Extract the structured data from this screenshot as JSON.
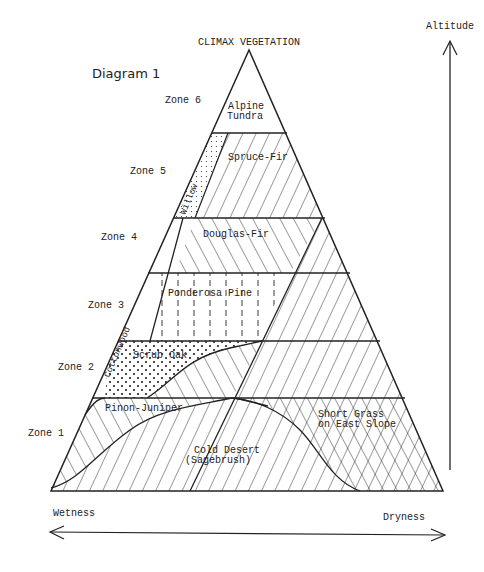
{
  "title": "CLIMAX VEGETATION",
  "diagram_label": "Diagram 1",
  "axes": {
    "vertical": "Altitude",
    "horizontal_left": "Wetness",
    "horizontal_right": "Dryness"
  },
  "zones": [
    {
      "label": "Zone 6"
    },
    {
      "label": "Zone 5"
    },
    {
      "label": "Zone 4"
    },
    {
      "label": "Zone 3"
    },
    {
      "label": "Zone 2"
    },
    {
      "label": "Zone 1"
    }
  ],
  "vegetation": {
    "alpine_line1": "Alpine",
    "alpine_line2": "Tundra",
    "spruce_fir": "Spruce-Fir",
    "willow": "Willow",
    "douglas_fir": "Douglas-Fir",
    "ponderosa": "Ponderosa Pine",
    "cottonwood": "Cottonwood",
    "scrub_oak": "Scrub Oak",
    "pinon_juniper": "Pinon-Juniper",
    "cold_desert_line1": "Cold Desert",
    "cold_desert_line2": "(Sagebrush)",
    "short_grass_line1": "Short Grass",
    "short_grass_line2": "on East Slope"
  },
  "colors": {
    "ink": "#222222",
    "background": "#ffffff"
  }
}
